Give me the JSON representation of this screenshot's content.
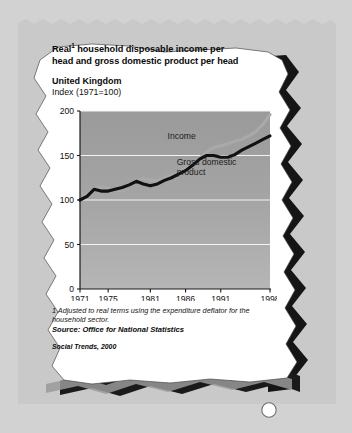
{
  "figure": {
    "title_line1_prefix": "Real",
    "title_footnote_marker": "1",
    "title_line1_rest": " household disposable income per",
    "title_line2": "head and gross domestic product per head",
    "region": "United Kingdom",
    "index_note": "Index (1971=100)",
    "footnote": "1 Adjusted to real terms using the expenditure deflator for the household sector.",
    "source": "Source: Office for National Statistics",
    "publication": "Social Trends, 2000"
  },
  "colors": {
    "paper_background": "#d2d2d2",
    "torn_sheet": "#c9c9c9",
    "card": "#ffffff",
    "shadow": "#1a1a1a",
    "plot_background_top": "#9b9b9b",
    "plot_background_bottom": "#b4b4b4",
    "gridline": "#f2f2f2",
    "income_line": "#a9a9a9",
    "gdp_line": "#111111",
    "axis": "#1a1a1a"
  },
  "chart_data": {
    "type": "line",
    "subtitle": "United Kingdom",
    "xlabel": "",
    "ylabel": "Index (1971=100)",
    "xlim": [
      1971,
      1998
    ],
    "ylim": [
      0,
      200
    ],
    "yticks": [
      0,
      50,
      100,
      150,
      200
    ],
    "xticks": [
      1971,
      1975,
      1981,
      1986,
      1991,
      1998
    ],
    "xtick_labels": [
      "1971",
      "1975",
      "1981",
      "1986",
      "1991",
      "1998"
    ],
    "ytick_labels": [
      "0",
      "50",
      "100",
      "150",
      "200"
    ],
    "grid": true,
    "grid_axis": "y",
    "legend": "inline-labels",
    "annotations": [
      {
        "text": "Income",
        "x": 1986,
        "y": 168
      },
      {
        "text": "Gross domestic product",
        "x": 1989,
        "y": 139
      }
    ],
    "x": [
      1971,
      1972,
      1973,
      1974,
      1975,
      1976,
      1977,
      1978,
      1979,
      1980,
      1981,
      1982,
      1983,
      1984,
      1985,
      1986,
      1987,
      1988,
      1989,
      1990,
      1991,
      1992,
      1993,
      1994,
      1995,
      1996,
      1997,
      1998
    ],
    "series": [
      {
        "name": "Income",
        "color": "#a9a9a9",
        "values": [
          100,
          107,
          113,
          114,
          113,
          111,
          110,
          116,
          122,
          124,
          122,
          122,
          125,
          128,
          131,
          136,
          141,
          147,
          154,
          159,
          161,
          163,
          166,
          168,
          172,
          177,
          185,
          196
        ]
      },
      {
        "name": "Gross domestic product",
        "color": "#111111",
        "values": [
          100,
          104,
          112,
          110,
          110,
          112,
          114,
          117,
          121,
          118,
          116,
          118,
          122,
          125,
          129,
          133,
          139,
          146,
          150,
          150,
          148,
          148,
          151,
          156,
          160,
          164,
          168,
          172
        ]
      }
    ]
  }
}
